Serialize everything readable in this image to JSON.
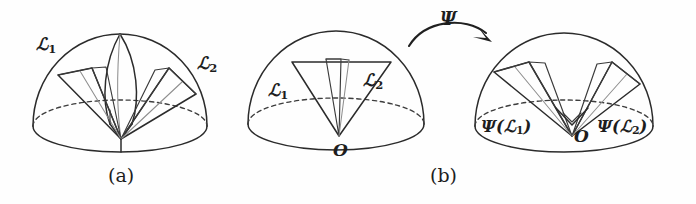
{
  "figure": {
    "caption_a": "(a)",
    "caption_b": "(b)",
    "map_symbol": "Ψ",
    "origin_label": "O",
    "origin_label_b": "O",
    "cone_label_1": "ℒ",
    "cone_label_1_sub": "1",
    "cone_label_2": "ℒ",
    "cone_label_2_sub": "2",
    "panel_a": {
      "label_left": "ℒ",
      "label_left_sub": "1",
      "label_right": "ℒ",
      "label_right_sub": "2"
    },
    "panel_b_left": {
      "label_left": "ℒ",
      "label_left_sub": "1",
      "label_right": "ℒ",
      "label_right_sub": "2",
      "origin": "O"
    },
    "panel_b_right": {
      "label_left": "Ψ(ℒ",
      "label_left_sub": "1",
      "label_left_close": ")",
      "label_right": "Ψ(ℒ",
      "label_right_sub": "2",
      "label_right_close": ")",
      "origin": "O"
    },
    "colors": {
      "background": "#fefefe",
      "ink": "#2b2b2b",
      "ink_faint": "#8e8e8e",
      "dashed": "#3d3d3d"
    }
  }
}
